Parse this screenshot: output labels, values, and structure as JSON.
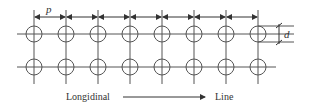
{
  "diagram": {
    "type": "grid-of-holes",
    "rows": 2,
    "columns": 8,
    "pitch_label": "p",
    "diameter_label": "d",
    "direction_label_left": "Longidinal",
    "direction_label_right": "Line",
    "direction_arrow": "right-arrow",
    "colors": {
      "line": "#555555",
      "text": "#333333",
      "background": "#ffffff"
    }
  }
}
